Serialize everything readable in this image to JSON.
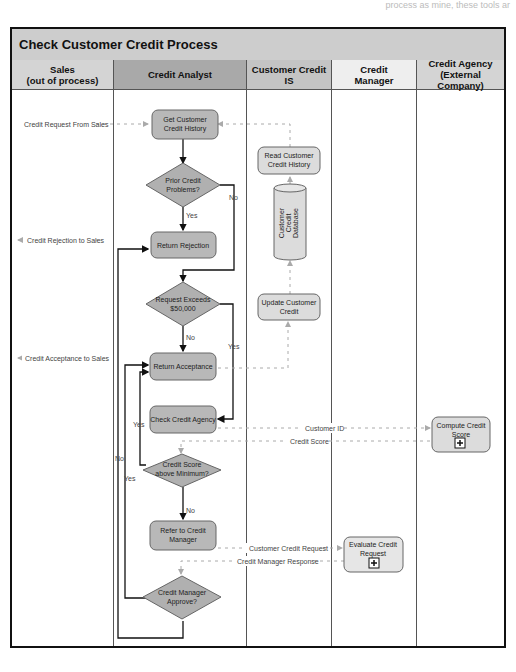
{
  "page": {
    "top_cropped_text": "process as mine, these tools ar"
  },
  "diagram": {
    "title": "Check Customer Credit Process",
    "lanes": [
      {
        "name": "Sales\n(out of process)",
        "color": "#d4d4d4"
      },
      {
        "name": "Credit Analyst",
        "color": "#a9a9a9"
      },
      {
        "name": "Customer Credit IS",
        "color": "#c4c4c4"
      },
      {
        "name": "Credit\nManager",
        "color": "#eeeeee"
      },
      {
        "name": "Credit Agency\n(External Company)",
        "color": "#d4d4d4"
      }
    ],
    "colors": {
      "analyst_task_fill": "#b8b8b8",
      "is_task_fill": "#dcdcdc",
      "decision_fill": "#b0b0b0",
      "flow_line": "#111111",
      "message_line": "#aaaaaa"
    },
    "tasks": {
      "get_history": "Get Customer\nCredit History",
      "read_history": "Read Customer\nCredit History",
      "return_rejection": "Return Rejection",
      "update_credit": "Update Customer\nCredit",
      "return_acceptance": "Return Acceptance",
      "check_agency": "Check Credit Agency",
      "compute_score": "Compute Credit\nScore",
      "refer_manager": "Refer to Credit\nManager",
      "evaluate_request": "Evaluate Credit\nRequest"
    },
    "database": "Customer\nCredit\nDatabase",
    "decisions": {
      "prior_problems": "Prior Credit\nProblems?",
      "exceeds": "Request Exceeds\n$50,000",
      "score_min": "Credit Score\nabove Minimum?",
      "manager_approve": "Credit Manager\nApprove?"
    },
    "messages": {
      "credit_request": "Credit Request From Sales",
      "credit_rejection": "Credit Rejection to Sales",
      "credit_acceptance": "Credit Acceptance to Sales",
      "customer_id": "Customer ID",
      "credit_score": "Credit Score",
      "customer_credit_request": "Customer Credit Request",
      "manager_response": "Credit Manager Response"
    },
    "labels": {
      "yes": "Yes",
      "no": "No"
    }
  }
}
